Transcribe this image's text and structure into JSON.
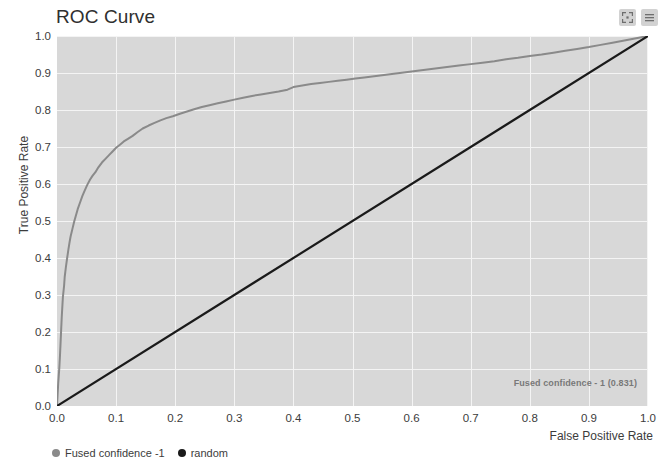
{
  "chart": {
    "title": "ROC Curve",
    "annotation": "Fused confidence - 1 (0.831)",
    "controls": [
      {
        "name": "fullscreen-icon",
        "label": "Fullscreen"
      },
      {
        "name": "menu-icon",
        "label": "Menu"
      }
    ],
    "legend": [
      {
        "label": "Fused confidence -1",
        "color": "#8a8a8a"
      },
      {
        "label": "random",
        "color": "#1a1a1a"
      }
    ]
  },
  "chart_data": {
    "type": "line",
    "title": "ROC Curve",
    "xlabel": "False Positive Rate",
    "ylabel": "True Positive Rate",
    "xlim": [
      0.0,
      1.0
    ],
    "ylim": [
      0.0,
      1.0
    ],
    "grid": true,
    "legend_position": "bottom-left",
    "plot_background": "#d8d8d8",
    "gridline_color": "#f4f4f4",
    "annotations": [
      {
        "text": "Fused confidence - 1 (0.831)",
        "x": 0.86,
        "y": 0.05,
        "auc": 0.831
      }
    ],
    "xticks": [
      "0.0",
      "0.1",
      "0.2",
      "0.3",
      "0.4",
      "0.5",
      "0.6",
      "0.7",
      "0.8",
      "0.9",
      "1.0"
    ],
    "xtick_values": [
      0.0,
      0.1,
      0.2,
      0.3,
      0.4,
      0.5,
      0.6,
      0.7,
      0.8,
      0.9,
      1.0
    ],
    "yticks": [
      "0.0",
      "0.1",
      "0.2",
      "0.3",
      "0.4",
      "0.5",
      "0.6",
      "0.7",
      "0.8",
      "0.9",
      "1.0"
    ],
    "ytick_values": [
      0.0,
      0.1,
      0.2,
      0.3,
      0.4,
      0.5,
      0.6,
      0.7,
      0.8,
      0.9,
      1.0
    ],
    "series": [
      {
        "name": "Fused confidence -1",
        "color": "#8a8a8a",
        "width": 2,
        "auc": 0.831,
        "points": [
          [
            0.0,
            0.0
          ],
          [
            0.002,
            0.06
          ],
          [
            0.004,
            0.105
          ],
          [
            0.005,
            0.135
          ],
          [
            0.006,
            0.17
          ],
          [
            0.007,
            0.205
          ],
          [
            0.008,
            0.24
          ],
          [
            0.009,
            0.268
          ],
          [
            0.01,
            0.295
          ],
          [
            0.012,
            0.325
          ],
          [
            0.013,
            0.348
          ],
          [
            0.015,
            0.375
          ],
          [
            0.017,
            0.398
          ],
          [
            0.019,
            0.42
          ],
          [
            0.021,
            0.44
          ],
          [
            0.023,
            0.458
          ],
          [
            0.026,
            0.478
          ],
          [
            0.029,
            0.498
          ],
          [
            0.032,
            0.515
          ],
          [
            0.035,
            0.532
          ],
          [
            0.039,
            0.55
          ],
          [
            0.043,
            0.568
          ],
          [
            0.047,
            0.583
          ],
          [
            0.051,
            0.597
          ],
          [
            0.056,
            0.612
          ],
          [
            0.06,
            0.622
          ],
          [
            0.065,
            0.632
          ],
          [
            0.07,
            0.645
          ],
          [
            0.076,
            0.658
          ],
          [
            0.082,
            0.668
          ],
          [
            0.088,
            0.678
          ],
          [
            0.094,
            0.688
          ],
          [
            0.1,
            0.698
          ],
          [
            0.107,
            0.707
          ],
          [
            0.113,
            0.715
          ],
          [
            0.12,
            0.722
          ],
          [
            0.128,
            0.73
          ],
          [
            0.136,
            0.74
          ],
          [
            0.145,
            0.75
          ],
          [
            0.155,
            0.758
          ],
          [
            0.165,
            0.765
          ],
          [
            0.175,
            0.772
          ],
          [
            0.185,
            0.778
          ],
          [
            0.196,
            0.783
          ],
          [
            0.208,
            0.79
          ],
          [
            0.22,
            0.796
          ],
          [
            0.232,
            0.802
          ],
          [
            0.245,
            0.808
          ],
          [
            0.258,
            0.813
          ],
          [
            0.272,
            0.818
          ],
          [
            0.286,
            0.823
          ],
          [
            0.3,
            0.828
          ],
          [
            0.315,
            0.833
          ],
          [
            0.33,
            0.838
          ],
          [
            0.345,
            0.842
          ],
          [
            0.36,
            0.846
          ],
          [
            0.375,
            0.85
          ],
          [
            0.39,
            0.855
          ],
          [
            0.4,
            0.862
          ],
          [
            0.415,
            0.866
          ],
          [
            0.43,
            0.87
          ],
          [
            0.445,
            0.873
          ],
          [
            0.46,
            0.876
          ],
          [
            0.475,
            0.879
          ],
          [
            0.49,
            0.882
          ],
          [
            0.505,
            0.885
          ],
          [
            0.52,
            0.888
          ],
          [
            0.54,
            0.892
          ],
          [
            0.56,
            0.896
          ],
          [
            0.58,
            0.9
          ],
          [
            0.6,
            0.904
          ],
          [
            0.62,
            0.908
          ],
          [
            0.64,
            0.912
          ],
          [
            0.66,
            0.916
          ],
          [
            0.68,
            0.92
          ],
          [
            0.7,
            0.924
          ],
          [
            0.72,
            0.928
          ],
          [
            0.74,
            0.932
          ],
          [
            0.76,
            0.937
          ],
          [
            0.78,
            0.941
          ],
          [
            0.8,
            0.946
          ],
          [
            0.82,
            0.95
          ],
          [
            0.84,
            0.955
          ],
          [
            0.86,
            0.96
          ],
          [
            0.88,
            0.965
          ],
          [
            0.9,
            0.97
          ],
          [
            0.92,
            0.976
          ],
          [
            0.94,
            0.982
          ],
          [
            0.96,
            0.988
          ],
          [
            0.98,
            0.994
          ],
          [
            1.0,
            1.0
          ]
        ]
      },
      {
        "name": "random",
        "color": "#1a1a1a",
        "width": 2.2,
        "auc": 0.5,
        "points": [
          [
            0.0,
            0.0
          ],
          [
            1.0,
            1.0
          ]
        ]
      }
    ]
  }
}
